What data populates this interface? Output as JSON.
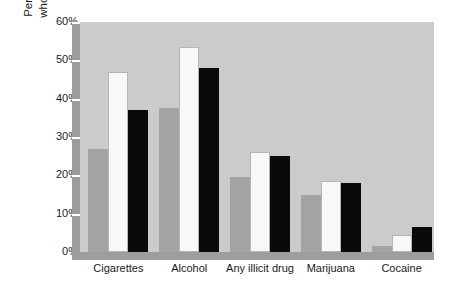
{
  "chart_data": {
    "type": "bar",
    "title": "",
    "xlabel": "",
    "ylabel_line1": "Percent of 12 to 17 year-olds",
    "ylabel_line2": "who ever used the substance",
    "categories": [
      "Cigarettes",
      "Alcohol",
      "Any illicit drug",
      "Marijuana",
      "Cocaine"
    ],
    "series": [
      {
        "name": "series-1",
        "color": "#a3a3a3",
        "values": [
          27,
          37.5,
          19.5,
          15,
          1.5
        ]
      },
      {
        "name": "series-2",
        "color": "#f8f8f8",
        "values": [
          47,
          53.5,
          26,
          18.5,
          4.5
        ]
      },
      {
        "name": "series-3",
        "color": "#0a0a0a",
        "values": [
          37,
          48,
          25,
          18,
          6.5
        ]
      }
    ],
    "ylim": [
      0,
      60
    ],
    "yticks": [
      0,
      10,
      20,
      30,
      40,
      50,
      60
    ],
    "ytick_labels": [
      "0%",
      "10%",
      "20%",
      "30%",
      "40%",
      "50%",
      "60%"
    ],
    "grid": false,
    "legend": "none",
    "plot_background": "#cbcbcb",
    "axis_band_color": "#9d9d9d",
    "page_background": "#ffffff"
  }
}
